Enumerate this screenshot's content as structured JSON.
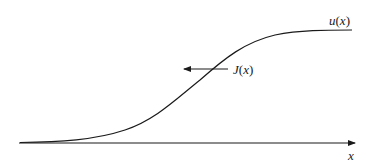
{
  "diagram": {
    "type": "sigmoid-profile",
    "curve": {
      "name": "u(x)",
      "label_fn": "u",
      "label_arg": "x",
      "color": "#1a1a1a"
    },
    "flux_arrow": {
      "name": "J(x)",
      "label_fn": "J",
      "label_arg": "x",
      "direction": "left",
      "color": "#1a1a1a"
    },
    "axis": {
      "label": "x",
      "color": "#1a1a1a"
    }
  }
}
